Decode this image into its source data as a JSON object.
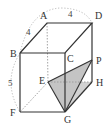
{
  "diagram": {
    "type": "cuboid-with-triangle",
    "vertices": {
      "A": {
        "label": "A",
        "x": 47,
        "y": 23
      },
      "B": {
        "label": "B",
        "x": 20,
        "y": 53
      },
      "C": {
        "label": "C",
        "x": 65,
        "y": 53
      },
      "D": {
        "label": "D",
        "x": 92,
        "y": 23
      },
      "E": {
        "label": "E",
        "x": 48,
        "y": 82
      },
      "F": {
        "label": "F",
        "x": 20,
        "y": 112
      },
      "G": {
        "label": "G",
        "x": 65,
        "y": 112
      },
      "H": {
        "label": "H",
        "x": 92,
        "y": 82
      },
      "P": {
        "label": "P",
        "x": 92,
        "y": 60
      }
    },
    "dimensions": {
      "AB": "4",
      "AD": "4",
      "BF": "5"
    },
    "shaded_triangle": [
      "E",
      "G",
      "P"
    ],
    "colors": {
      "line": "#333333",
      "hidden": "#9a9a9a",
      "shade": "#c8c8c8",
      "arc": "#b0b0b0"
    }
  }
}
